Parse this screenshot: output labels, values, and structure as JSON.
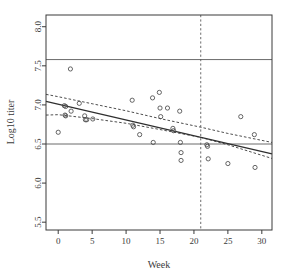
{
  "chart_data": {
    "type": "scatter",
    "title": "",
    "xlabel": "Week",
    "ylabel": "Log10 titer",
    "xlim": [
      -1.8,
      31.5
    ],
    "ylim": [
      5.4,
      8.15
    ],
    "xticks": [
      0,
      5,
      10,
      15,
      20,
      25,
      30
    ],
    "xtick_labels": [
      "0",
      "5",
      "10",
      "15",
      "20",
      "25",
      "30"
    ],
    "yticks": [
      5.5,
      6.0,
      6.5,
      7.0,
      7.5,
      8.0
    ],
    "ytick_labels": [
      "5.5",
      "6.0",
      "6.5",
      "7.0",
      "7.5",
      "8.0"
    ],
    "grid": false,
    "legend": null,
    "points": [
      {
        "x": 0.0,
        "y": 6.65
      },
      {
        "x": 0.9,
        "y": 6.99
      },
      {
        "x": 1.1,
        "y": 6.98
      },
      {
        "x": 1.0,
        "y": 6.87
      },
      {
        "x": 1.1,
        "y": 6.86
      },
      {
        "x": 1.8,
        "y": 7.46
      },
      {
        "x": 1.9,
        "y": 6.92
      },
      {
        "x": 3.1,
        "y": 7.02
      },
      {
        "x": 3.9,
        "y": 6.86
      },
      {
        "x": 4.0,
        "y": 6.81
      },
      {
        "x": 4.2,
        "y": 6.81
      },
      {
        "x": 5.1,
        "y": 6.82
      },
      {
        "x": 10.9,
        "y": 7.06
      },
      {
        "x": 11.0,
        "y": 6.74
      },
      {
        "x": 11.1,
        "y": 6.72
      },
      {
        "x": 12.0,
        "y": 6.62
      },
      {
        "x": 13.9,
        "y": 7.09
      },
      {
        "x": 14.0,
        "y": 6.52
      },
      {
        "x": 14.9,
        "y": 7.16
      },
      {
        "x": 15.0,
        "y": 6.96
      },
      {
        "x": 15.1,
        "y": 6.85
      },
      {
        "x": 16.1,
        "y": 6.96
      },
      {
        "x": 16.9,
        "y": 6.7
      },
      {
        "x": 17.0,
        "y": 6.67
      },
      {
        "x": 17.9,
        "y": 6.92
      },
      {
        "x": 18.0,
        "y": 6.52
      },
      {
        "x": 18.1,
        "y": 6.39
      },
      {
        "x": 18.1,
        "y": 6.29
      },
      {
        "x": 21.9,
        "y": 6.49
      },
      {
        "x": 22.0,
        "y": 6.47
      },
      {
        "x": 22.1,
        "y": 6.31
      },
      {
        "x": 25.0,
        "y": 6.25
      },
      {
        "x": 26.9,
        "y": 6.85
      },
      {
        "x": 28.9,
        "y": 6.62
      },
      {
        "x": 29.0,
        "y": 6.2
      }
    ],
    "regression_line": {
      "style": "solid",
      "x": [
        -1.8,
        31.5
      ],
      "y": [
        7.045,
        6.375
      ]
    },
    "confidence_band_upper": {
      "style": "dashed",
      "x": [
        -1.8,
        0,
        5,
        10,
        15,
        21,
        25,
        31.5
      ],
      "y": [
        7.135,
        7.105,
        7.015,
        6.925,
        6.825,
        6.715,
        6.635,
        6.52
      ]
    },
    "confidence_band_lower": {
      "style": "dashed",
      "x": [
        -1.8,
        0,
        5,
        10,
        15,
        21,
        25,
        31.5
      ],
      "y": [
        6.87,
        6.875,
        6.825,
        6.765,
        6.685,
        6.585,
        6.49,
        6.315
      ]
    },
    "hlines": [
      {
        "y": 7.58,
        "style": "solid"
      },
      {
        "y": 6.5,
        "style": "solid"
      }
    ],
    "vlines": [
      {
        "x": 21,
        "style": "dashed"
      }
    ],
    "colors": {
      "axis": "#3a3a3a",
      "point": "#4a4a4a",
      "line": "#2f2f2f",
      "band": "#3a3a3a",
      "reference": "#5a5a5a",
      "background": "#ffffff"
    }
  }
}
